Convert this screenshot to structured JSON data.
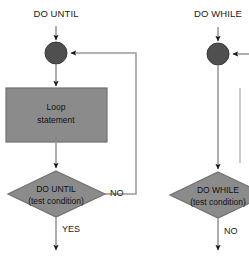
{
  "diagram": {
    "title_left": "DO UNTIL",
    "title_right": "DO WHILE",
    "colors": {
      "node_fill": "#4f4f4f",
      "shape_fill": "#8b8b8b",
      "shape_stroke": "#6f6f6f",
      "line": "#9a9a9a",
      "arrow": "#1a1a1a",
      "text": "#111111",
      "background": "#ffffff"
    }
  },
  "left_flow": {
    "entry_label": "DO UNTIL",
    "node_name": "loop-entry-node",
    "process": {
      "line1": "Loop",
      "line2": "statement"
    },
    "decision": {
      "line1": "DO UNTIL",
      "line2": "(test condition)"
    },
    "branch_no": "NO",
    "branch_yes": "YES"
  },
  "right_flow": {
    "entry_label": "DO WHILE",
    "node_name": "loop-entry-node",
    "decision": {
      "line1": "DO WHILE",
      "line2": "(test condition)"
    },
    "branch_no": "NO"
  }
}
